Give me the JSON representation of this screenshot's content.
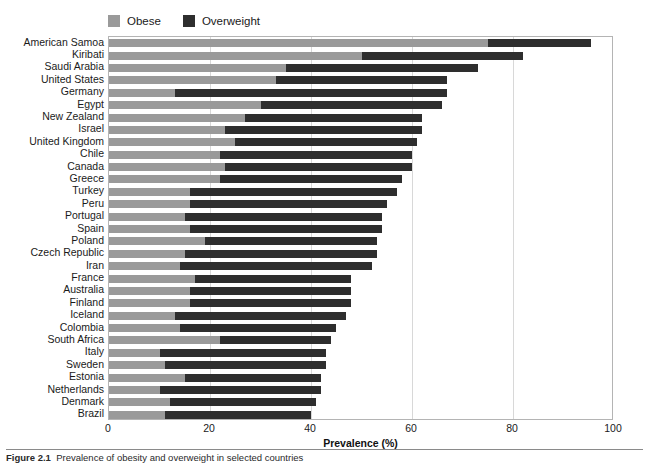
{
  "figure": {
    "caption_label": "Figure 2.1",
    "caption_text": "Prevalence of obesity and overweight in selected countries"
  },
  "legend": {
    "position": "top-left",
    "items": [
      {
        "label": "Obese",
        "color": "#9a9a9a",
        "icon": "legend-swatch-icon"
      },
      {
        "label": "Overweight",
        "color": "#2e2e2e",
        "icon": "legend-swatch-icon"
      }
    ]
  },
  "axis": {
    "x_title": "Prevalence (%)",
    "x_ticks": [
      "0",
      "20",
      "40",
      "60",
      "80",
      "100"
    ],
    "x_min": 0,
    "x_max": 100,
    "grid": true
  },
  "chart_data": {
    "type": "bar",
    "orientation": "horizontal",
    "stacked": true,
    "title": "",
    "subtitle": "",
    "xlabel": "Prevalence (%)",
    "ylabel": "",
    "xlim": [
      0,
      100
    ],
    "grid": true,
    "legend_position": "top-left",
    "categories": [
      "American Samoa",
      "Kiribati",
      "Saudi Arabia",
      "United States",
      "Germany",
      "Egypt",
      "New Zealand",
      "Israel",
      "United Kingdom",
      "Chile",
      "Canada",
      "Greece",
      "Turkey",
      "Peru",
      "Portugal",
      "Spain",
      "Poland",
      "Czech Republic",
      "Iran",
      "France",
      "Australia",
      "Finland",
      "Iceland",
      "Colombia",
      "South Africa",
      "Italy",
      "Sweden",
      "Estonia",
      "Netherlands",
      "Denmark",
      "Brazil"
    ],
    "series": [
      {
        "name": "Obese",
        "color": "#9a9a9a",
        "values": [
          75.0,
          50.0,
          35.0,
          33.0,
          13.0,
          30.0,
          27.0,
          23.0,
          25.0,
          22.0,
          23.0,
          22.0,
          16.0,
          16.0,
          15.0,
          16.0,
          19.0,
          15.0,
          14.0,
          17.0,
          16.0,
          16.0,
          13.0,
          14.0,
          22.0,
          10.0,
          11.0,
          15.0,
          10.0,
          12.0,
          11.0
        ]
      },
      {
        "name": "Overweight",
        "color": "#2e2e2e",
        "values": [
          20.5,
          32.0,
          38.0,
          34.0,
          54.0,
          36.0,
          35.0,
          39.0,
          36.0,
          38.0,
          37.0,
          36.0,
          41.0,
          39.0,
          39.0,
          38.0,
          34.0,
          38.0,
          38.0,
          31.0,
          32.0,
          32.0,
          34.0,
          31.0,
          22.0,
          33.0,
          32.0,
          27.0,
          32.0,
          29.0,
          29.0
        ]
      }
    ],
    "totals": [
      95.5,
      82.0,
      73.0,
      67.0,
      67.0,
      66.0,
      62.0,
      62.0,
      61.0,
      60.0,
      60.0,
      58.0,
      57.0,
      55.0,
      54.0,
      54.0,
      53.0,
      53.0,
      52.0,
      48.0,
      48.0,
      48.0,
      47.0,
      45.0,
      44.0,
      43.0,
      43.0,
      42.0,
      42.0,
      41.0,
      40.0
    ]
  }
}
